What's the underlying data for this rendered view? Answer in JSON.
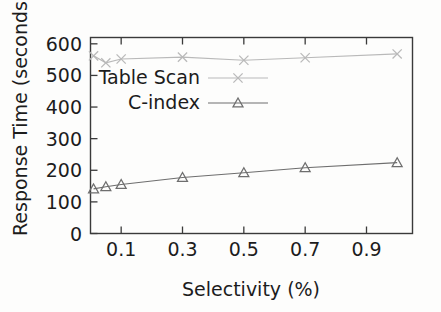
{
  "chart_data": {
    "type": "line",
    "title": "",
    "xlabel": "Selectivity (%)",
    "ylabel": "Response Time (seconds)",
    "xlim": [
      0.0,
      1.05
    ],
    "ylim": [
      0,
      620
    ],
    "grid": false,
    "legend_position": "upper-left-inside",
    "x": [
      0.01,
      0.05,
      0.1,
      0.3,
      0.5,
      0.7,
      1.0
    ],
    "xticks": [
      "0.1",
      "0.3",
      "0.5",
      "0.7",
      "0.9"
    ],
    "xtick_values": [
      0.1,
      0.3,
      0.5,
      0.7,
      0.9
    ],
    "yticks": [
      "0",
      "100",
      "200",
      "300",
      "400",
      "500",
      "600"
    ],
    "ytick_values": [
      0,
      100,
      200,
      300,
      400,
      500,
      600
    ],
    "series": [
      {
        "name": "Table Scan",
        "marker": "x",
        "color": "#b9b9b9",
        "values": [
          562,
          540,
          552,
          558,
          548,
          556,
          568
        ]
      },
      {
        "name": "C-index",
        "marker": "triangle-up",
        "color": "#6e6e6e",
        "values": [
          141,
          148,
          155,
          177,
          192,
          208,
          224
        ]
      }
    ]
  },
  "legend": {
    "entries": [
      {
        "label": "Table Scan"
      },
      {
        "label": "C-index"
      }
    ]
  },
  "axes": {
    "x_title": "Selectivity (%)",
    "y_title": "Response Time (seconds)"
  }
}
